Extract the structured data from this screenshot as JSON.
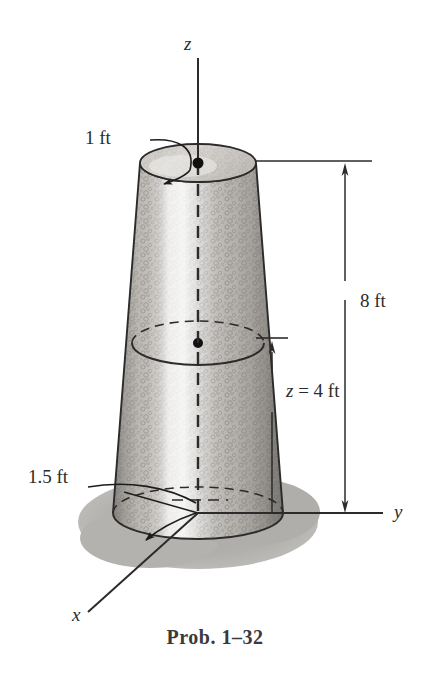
{
  "figure": {
    "caption": "Prob. 1–32",
    "axes": [
      {
        "name": "z-axis",
        "label": "z"
      },
      {
        "name": "y-axis",
        "label": "y"
      },
      {
        "name": "x-axis",
        "label": "x"
      }
    ],
    "annotations": {
      "top_radius": "1 ft",
      "total_height": "8 ft",
      "mid_height": "z = 4 ft",
      "mid_height_var": "z",
      "mid_height_eq": "= 4 ft",
      "base_radius": "1.5 ft"
    },
    "colors": {
      "line": "#2b2b2b",
      "body_light": "#f2f0ee",
      "body_mid": "#b9b6b2",
      "body_dark": "#8f8c88",
      "shadow": "#b3b1ae",
      "top_face": "#d8d5d1",
      "text": "#2b2b2b",
      "caption": "#3a3a3a"
    },
    "object": {
      "type": "truncated-cone-frustum",
      "top_diameter_label": "1 ft",
      "base_radius_label": "1.5 ft",
      "height_label": "8 ft",
      "section_height_label": "z = 4 ft"
    }
  }
}
